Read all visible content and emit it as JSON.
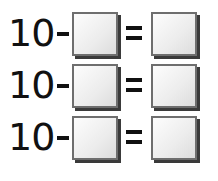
{
  "equations": [
    {
      "minuend": "10",
      "operator": "−",
      "equals": "=",
      "subtrahend_value": "",
      "result_value": ""
    },
    {
      "minuend": "10",
      "operator": "−",
      "equals": "=",
      "subtrahend_value": "",
      "result_value": ""
    },
    {
      "minuend": "10",
      "operator": "−",
      "equals": "=",
      "subtrahend_value": "",
      "result_value": ""
    }
  ],
  "colors": {
    "box_border": "#6e6e6e",
    "box_shadow": "#3a3a3a",
    "text": "#111111"
  }
}
